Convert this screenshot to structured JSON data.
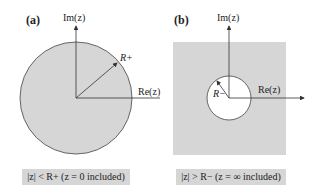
{
  "panels": [
    {
      "id": "a",
      "label": "(a)",
      "im_axis": "Im(z)",
      "re_axis": "Re(z)",
      "radius_label": "R+",
      "region": "interior of circle shaded",
      "caption": "|z| < R+ (z = 0 included)"
    },
    {
      "id": "b",
      "label": "(b)",
      "im_axis": "Im(z)",
      "re_axis": "Re(z)",
      "radius_label": "R−",
      "region": "exterior of circle shaded",
      "caption": "|z| > R− (z = ∞ included)"
    }
  ],
  "colors": {
    "shade": "#d6d6d6",
    "line": "#333333",
    "background": "#ffffff"
  }
}
